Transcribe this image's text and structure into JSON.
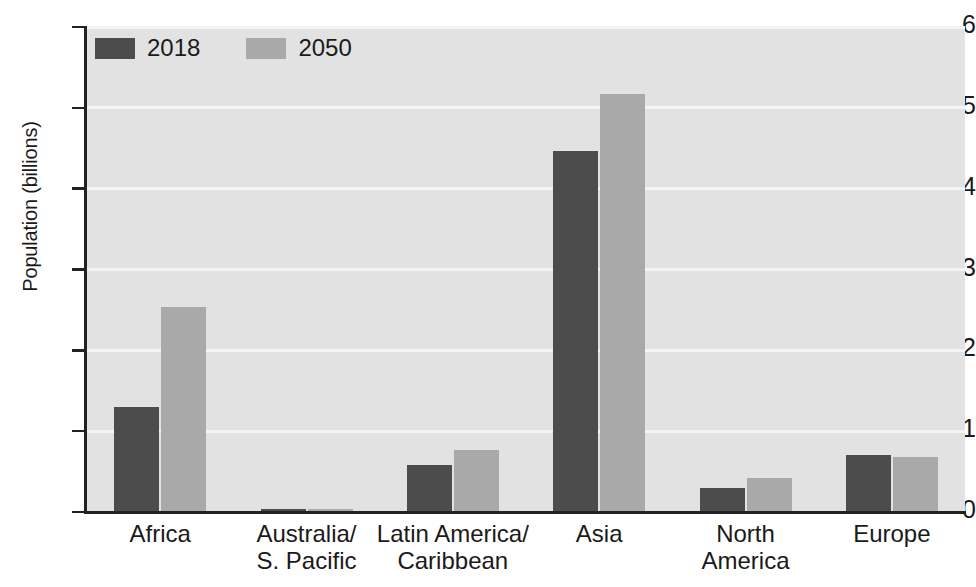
{
  "chart_data": {
    "type": "bar",
    "title": "",
    "xlabel": "",
    "ylabel": "Population (billions)",
    "ylim": [
      0,
      6
    ],
    "yticks": [
      0,
      1,
      2,
      3,
      4,
      5,
      6
    ],
    "ytick_labels": [
      "0",
      "1",
      "2",
      "3",
      "4",
      "5",
      "6"
    ],
    "grid": true,
    "legend_position": "top-left",
    "categories": [
      "Africa",
      "Australia/ S. Pacific",
      "Latin America/ Caribbean",
      "Asia",
      "North America",
      "Europe"
    ],
    "category_lines": [
      [
        "Africa",
        ""
      ],
      [
        "Australia/",
        "S. Pacific"
      ],
      [
        "Latin America/",
        "Caribbean"
      ],
      [
        "Asia",
        ""
      ],
      [
        "North",
        "America"
      ],
      [
        "Europe",
        ""
      ]
    ],
    "series": [
      {
        "name": "2018",
        "color": "#4c4c4c",
        "values": [
          1.3,
          0.04,
          0.58,
          4.47,
          0.3,
          0.7
        ]
      },
      {
        "name": "2050",
        "color": "#a9a9a9",
        "values": [
          2.54,
          0.04,
          0.77,
          5.17,
          0.42,
          0.68
        ]
      }
    ]
  },
  "legend": {
    "items": [
      {
        "label": "2018",
        "color": "#4c4c4c"
      },
      {
        "label": "2050",
        "color": "#a9a9a9"
      }
    ]
  },
  "colors": {
    "plot_background": "#e2e2e2",
    "gridline": "#f4f4f4",
    "axis": "#222222",
    "series_2018": "#4c4c4c",
    "series_2050": "#a9a9a9",
    "page_background": "#ffffff"
  }
}
